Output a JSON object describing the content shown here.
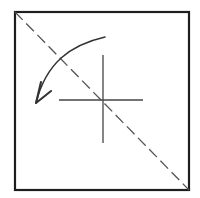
{
  "diagram": {
    "type": "origami-fold-step",
    "background": "#ffffff",
    "paper_square": {
      "x": 15,
      "y": 12,
      "width": 174,
      "height": 178,
      "stroke": "#1e1e1e",
      "stroke_width": 2.2
    },
    "valley_fold_line": {
      "style": "dashed",
      "from": [
        15,
        12
      ],
      "to": [
        189,
        190
      ],
      "stroke": "#555555",
      "stroke_width": 1.3,
      "dash": "11 5"
    },
    "center_cross": {
      "center": [
        103,
        100
      ],
      "vertical": {
        "from": [
          103,
          55
        ],
        "to": [
          103,
          143
        ]
      },
      "horizontal": {
        "from": [
          59,
          100
        ],
        "to": [
          143,
          100
        ]
      },
      "stroke": "#444444",
      "stroke_width": 1.3
    },
    "fold_arrow": {
      "direction": "fold top-right corner down to the left",
      "path_start": [
        105,
        37
      ],
      "path_end": [
        36,
        103
      ],
      "stroke": "#333333",
      "stroke_width": 1.5,
      "arrowhead": {
        "tip": [
          36,
          103
        ],
        "barb_left": [
          41,
          82
        ],
        "barb_right": [
          51,
          91
        ]
      }
    }
  }
}
